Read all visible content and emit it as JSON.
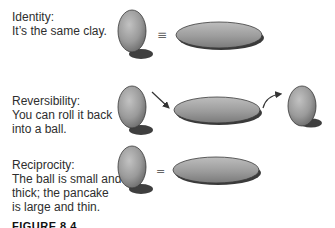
{
  "figure": {
    "caption": "FIGURE 8.4",
    "colors": {
      "clay_light": "#b5b5b5",
      "clay_dark": "#6e6e6e",
      "outline": "#3a3a3a",
      "shadow": "#2a2a2a",
      "text": "#2e2e2e"
    },
    "rows": [
      {
        "id": "identity",
        "title": "Identity:",
        "lines": [
          "It’s the same clay."
        ],
        "connector": "≡",
        "shapes": [
          "ball",
          "pancake"
        ]
      },
      {
        "id": "reversibility",
        "title": "Reversibility:",
        "lines": [
          "You can roll it back",
          "into a ball."
        ],
        "connector": "arrow",
        "shapes": [
          "ball",
          "pancake",
          "ball"
        ]
      },
      {
        "id": "reciprocity",
        "title": "Reciprocity:",
        "lines": [
          "The ball is small and",
          "thick; the pancake",
          "is large and thin."
        ],
        "connector": "=",
        "shapes": [
          "ball",
          "pancake"
        ]
      }
    ]
  }
}
